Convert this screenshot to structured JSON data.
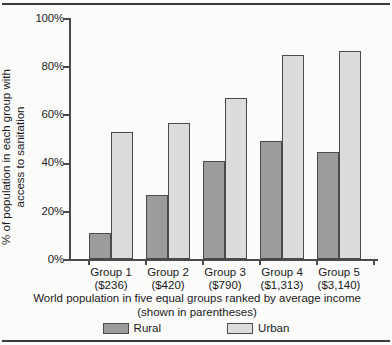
{
  "chart_data": {
    "type": "bar",
    "title": "",
    "xlabel": "World population in five equal groups ranked by average income (shown in parentheses)",
    "xlabel_line1": "World population in five equal groups ranked by average income",
    "xlabel_line2": "(shown in parentheses)",
    "ylabel": "% of population in each group with access to sanitation",
    "ylabel_line1": "% of population in each group with",
    "ylabel_line2": "access to sanitation",
    "ylim": [
      0,
      100
    ],
    "ytick_labels": [
      "100%",
      "80%",
      "60%",
      "40%",
      "20%",
      "0%"
    ],
    "ytick_values": [
      100,
      80,
      60,
      40,
      20,
      0
    ],
    "grid": false,
    "legend_position": "bottom",
    "categories": [
      "Group 1",
      "Group 2",
      "Group 3",
      "Group 4",
      "Group 5"
    ],
    "category_sublabels": [
      "($236)",
      "($420)",
      "($790)",
      "($1,313)",
      "($3,140)"
    ],
    "series": [
      {
        "name": "Rural",
        "color": "#9c9c9c",
        "values": [
          11,
          26.5,
          40.5,
          49,
          44.5
        ]
      },
      {
        "name": "Urban",
        "color": "#dcdcdc",
        "values": [
          52.5,
          56.5,
          67,
          84.5,
          86.5
        ]
      }
    ]
  },
  "axis": {
    "y_ticks": [
      {
        "label": "100%",
        "value": 100
      },
      {
        "label": "80%",
        "value": 80
      },
      {
        "label": "60%",
        "value": 60
      },
      {
        "label": "40%",
        "value": 40
      },
      {
        "label": "20%",
        "value": 20
      },
      {
        "label": "0%",
        "value": 0
      }
    ]
  },
  "groups": [
    {
      "name": "Group 1",
      "income": "($236)",
      "rural": 11,
      "urban": 52.5
    },
    {
      "name": "Group 2",
      "income": "($420)",
      "rural": 26.5,
      "urban": 56.5
    },
    {
      "name": "Group 3",
      "income": "($790)",
      "rural": 40.5,
      "urban": 67
    },
    {
      "name": "Group 4",
      "income": "($1,313)",
      "rural": 49,
      "urban": 84.5
    },
    {
      "name": "Group 5",
      "income": "($3,140)",
      "rural": 44.5,
      "urban": 86.5
    }
  ],
  "legend": {
    "items": [
      {
        "label": "Rural",
        "color": "#9c9c9c"
      },
      {
        "label": "Urban",
        "color": "#dcdcdc"
      }
    ]
  },
  "colors": {
    "rural": "#9c9c9c",
    "urban": "#dcdcdc",
    "axis": "#4a4a4a",
    "background": "#fbfbfa",
    "text": "#1a1a1a"
  }
}
